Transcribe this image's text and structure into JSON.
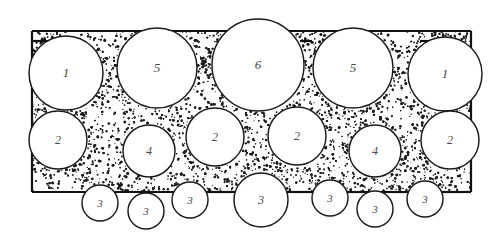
{
  "figure": {
    "background_color": "#ffffff",
    "outline_color": "#1a1a1a",
    "label_color": "#4a4a4a",
    "matrix_color": "#1c1c1c",
    "frame_color": "#111111"
  },
  "frame": {
    "name": "container-outline",
    "left": 32,
    "right": 471,
    "top": 31,
    "bottom": 192,
    "stroke_width": 2.2
  },
  "particles": [
    {
      "id": "p1",
      "label": "1",
      "cx": 66,
      "cy": 73,
      "r": 37,
      "row": "top",
      "font_size": 13
    },
    {
      "id": "p2",
      "label": "5",
      "cx": 157,
      "cy": 68,
      "r": 40,
      "row": "top",
      "font_size": 13
    },
    {
      "id": "p3",
      "label": "6",
      "cx": 258,
      "cy": 65,
      "r": 46,
      "row": "top",
      "font_size": 13
    },
    {
      "id": "p4",
      "label": "5",
      "cx": 353,
      "cy": 68,
      "r": 40,
      "row": "top",
      "font_size": 13
    },
    {
      "id": "p5",
      "label": "1",
      "cx": 445,
      "cy": 74,
      "r": 37,
      "row": "top",
      "font_size": 13
    },
    {
      "id": "p6",
      "label": "2",
      "cx": 58,
      "cy": 140,
      "r": 29,
      "row": "middle",
      "font_size": 12
    },
    {
      "id": "p7",
      "label": "4",
      "cx": 149,
      "cy": 151,
      "r": 26,
      "row": "middle",
      "font_size": 12
    },
    {
      "id": "p8",
      "label": "2",
      "cx": 215,
      "cy": 137,
      "r": 29,
      "row": "middle",
      "font_size": 12
    },
    {
      "id": "p9",
      "label": "2",
      "cx": 297,
      "cy": 136,
      "r": 29,
      "row": "middle",
      "font_size": 12
    },
    {
      "id": "p10",
      "label": "4",
      "cx": 375,
      "cy": 151,
      "r": 26,
      "row": "middle",
      "font_size": 12
    },
    {
      "id": "p11",
      "label": "2",
      "cx": 450,
      "cy": 140,
      "r": 29,
      "row": "middle",
      "font_size": 12
    },
    {
      "id": "p12",
      "label": "3",
      "cx": 100,
      "cy": 203,
      "r": 18,
      "row": "bottom",
      "font_size": 11
    },
    {
      "id": "p13",
      "label": "3",
      "cx": 146,
      "cy": 211,
      "r": 18,
      "row": "bottom",
      "font_size": 11
    },
    {
      "id": "p14",
      "label": "3",
      "cx": 190,
      "cy": 200,
      "r": 18,
      "row": "bottom",
      "font_size": 11
    },
    {
      "id": "p15",
      "label": "3",
      "cx": 261,
      "cy": 200,
      "r": 27,
      "row": "bottom",
      "font_size": 12
    },
    {
      "id": "p16",
      "label": "3",
      "cx": 330,
      "cy": 198,
      "r": 18,
      "row": "bottom",
      "font_size": 11
    },
    {
      "id": "p17",
      "label": "3",
      "cx": 375,
      "cy": 209,
      "r": 18,
      "row": "bottom",
      "font_size": 11
    },
    {
      "id": "p18",
      "label": "3",
      "cx": 425,
      "cy": 199,
      "r": 18,
      "row": "bottom",
      "font_size": 11
    }
  ],
  "legend": {
    "size_classes": [
      "1",
      "2",
      "3",
      "4",
      "5",
      "6"
    ]
  }
}
